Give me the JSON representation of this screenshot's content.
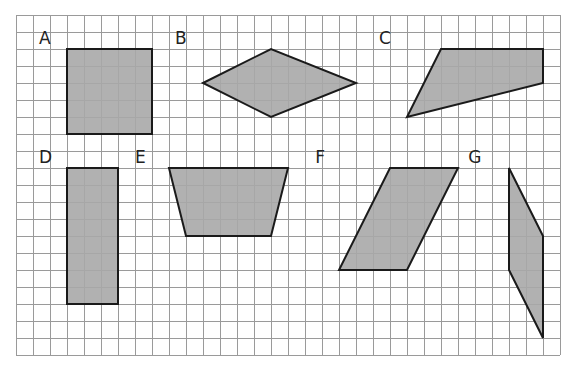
{
  "grid": {
    "origin_x": 16,
    "origin_y": 15,
    "cell": 17,
    "cols": 32,
    "rows": 20,
    "line_color": "#9a9a9a",
    "line_width": 1
  },
  "style": {
    "fill": "#a9a9a9",
    "stroke": "#1a1a1a",
    "stroke_width": 2
  },
  "shapes": [
    {
      "label": "A",
      "label_pos": [
        1.35,
        1.7
      ],
      "type": "square",
      "points": [
        [
          3,
          2
        ],
        [
          8,
          2
        ],
        [
          8,
          7
        ],
        [
          3,
          7
        ]
      ]
    },
    {
      "label": "B",
      "label_pos": [
        9.35,
        1.7
      ],
      "type": "rhombus",
      "points": [
        [
          11,
          4
        ],
        [
          15,
          2
        ],
        [
          20,
          4
        ],
        [
          15,
          6
        ]
      ]
    },
    {
      "label": "C",
      "label_pos": [
        21.35,
        1.7
      ],
      "type": "quadrilateral",
      "points": [
        [
          25,
          2
        ],
        [
          31,
          2
        ],
        [
          31,
          4
        ],
        [
          23,
          6
        ]
      ]
    },
    {
      "label": "D",
      "label_pos": [
        1.35,
        8.7
      ],
      "type": "rectangle",
      "points": [
        [
          3,
          9
        ],
        [
          6,
          9
        ],
        [
          6,
          17
        ],
        [
          3,
          17
        ]
      ]
    },
    {
      "label": "E",
      "label_pos": [
        7.0,
        8.7
      ],
      "type": "trapezoid",
      "points": [
        [
          9,
          9
        ],
        [
          16,
          9
        ],
        [
          15,
          13
        ],
        [
          10,
          13
        ]
      ]
    },
    {
      "label": "F",
      "label_pos": [
        17.6,
        8.7
      ],
      "type": "parallelogram",
      "points": [
        [
          22,
          9
        ],
        [
          26,
          9
        ],
        [
          23,
          15
        ],
        [
          19,
          15
        ]
      ]
    },
    {
      "label": "G",
      "label_pos": [
        26.6,
        8.7
      ],
      "type": "parallelogram",
      "points": [
        [
          29,
          9
        ],
        [
          31,
          13
        ],
        [
          31,
          19
        ],
        [
          29,
          15
        ]
      ]
    }
  ]
}
